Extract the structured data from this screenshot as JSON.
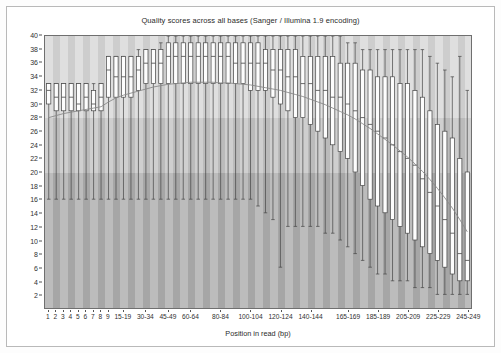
{
  "chart": {
    "title": "Quality scores across all bases (Sanger / Illumina 1.9 encoding)",
    "xlabel": "Position in read (bp)",
    "ylabel": ""
  },
  "chart_data": {
    "type": "box",
    "title": "Quality scores across all bases (Sanger / Illumina 1.9 encoding)",
    "xlabel": "Position in read (bp)",
    "ylabel": "",
    "ylim": [
      0,
      40
    ],
    "ytick_labels": [
      "2",
      "4",
      "6",
      "8",
      "10",
      "12",
      "14",
      "16",
      "18",
      "20",
      "22",
      "24",
      "26",
      "28",
      "30",
      "32",
      "34",
      "36",
      "38",
      "40"
    ],
    "ytick_values": [
      2,
      4,
      6,
      8,
      10,
      12,
      14,
      16,
      18,
      20,
      22,
      24,
      26,
      28,
      30,
      32,
      34,
      36,
      38,
      40
    ],
    "grid": false,
    "legend": null,
    "background_bands": [
      {
        "name": "good-quality-band",
        "from": 28,
        "to": 40,
        "color": "#d9d9d9"
      },
      {
        "name": "reasonable-quality-band",
        "from": 20,
        "to": 28,
        "color": "#c6c6c6"
      },
      {
        "name": "poor-quality-band",
        "from": 0,
        "to": 20,
        "color": "#b0b0b0"
      }
    ],
    "categories": [
      "1",
      "2",
      "3",
      "4",
      "5",
      "6",
      "7",
      "8",
      "9",
      "10-14",
      "15-19",
      "20-24",
      "25-29",
      "30-34",
      "35-39",
      "40-44",
      "45-49",
      "50-54",
      "55-59",
      "60-64",
      "65-69",
      "70-74",
      "75-79",
      "80-84",
      "85-89",
      "90-94",
      "95-99",
      "100-104",
      "105-109",
      "110-114",
      "115-119",
      "120-124",
      "125-129",
      "130-134",
      "135-139",
      "140-144",
      "145-149",
      "150-154",
      "155-159",
      "160-164",
      "165-169",
      "170-174",
      "175-179",
      "180-184",
      "185-189",
      "190-194",
      "195-199",
      "200-204",
      "205-209",
      "210-214",
      "215-219",
      "220-224",
      "225-229",
      "230-234",
      "235-239",
      "240-244",
      "245-249"
    ],
    "xtick_labels": [
      "1",
      "2",
      "3",
      "4",
      "5",
      "6",
      "7",
      "8",
      "9",
      "15-19",
      "30-34",
      "45-49",
      "60-64",
      "80-84",
      "100-104",
      "120-124",
      "140-144",
      "165-169",
      "185-189",
      "205-209",
      "225-229",
      "245-249"
    ],
    "xtick_category_index": [
      0,
      1,
      2,
      3,
      4,
      5,
      6,
      7,
      8,
      10,
      13,
      16,
      19,
      23,
      27,
      31,
      35,
      40,
      44,
      48,
      52,
      56
    ],
    "boxes": [
      {
        "category": "1",
        "lower_whisker": 16,
        "q1": 30,
        "median": 32,
        "q3": 33,
        "upper_whisker": 33
      },
      {
        "category": "2",
        "lower_whisker": 16,
        "q1": 29,
        "median": 31,
        "q3": 33,
        "upper_whisker": 33
      },
      {
        "category": "3",
        "lower_whisker": 16,
        "q1": 29,
        "median": 31,
        "q3": 33,
        "upper_whisker": 33
      },
      {
        "category": "4",
        "lower_whisker": 16,
        "q1": 29,
        "median": 31,
        "q3": 33,
        "upper_whisker": 33
      },
      {
        "category": "5",
        "lower_whisker": 16,
        "q1": 29,
        "median": 30,
        "q3": 33,
        "upper_whisker": 33
      },
      {
        "category": "6",
        "lower_whisker": 16,
        "q1": 29,
        "median": 31,
        "q3": 33,
        "upper_whisker": 33
      },
      {
        "category": "7",
        "lower_whisker": 16,
        "q1": 29,
        "median": 30,
        "q3": 32,
        "upper_whisker": 33
      },
      {
        "category": "8",
        "lower_whisker": 16,
        "q1": 29,
        "median": 31,
        "q3": 33,
        "upper_whisker": 33
      },
      {
        "category": "9",
        "lower_whisker": 16,
        "q1": 31,
        "median": 35,
        "q3": 37,
        "upper_whisker": 37
      },
      {
        "category": "10-14",
        "lower_whisker": 16,
        "q1": 31,
        "median": 34,
        "q3": 37,
        "upper_whisker": 37
      },
      {
        "category": "15-19",
        "lower_whisker": 16,
        "q1": 31,
        "median": 34,
        "q3": 37,
        "upper_whisker": 37
      },
      {
        "category": "20-24",
        "lower_whisker": 16,
        "q1": 31,
        "median": 34,
        "q3": 37,
        "upper_whisker": 37
      },
      {
        "category": "25-29",
        "lower_whisker": 16,
        "q1": 32,
        "median": 35,
        "q3": 37,
        "upper_whisker": 38
      },
      {
        "category": "30-34",
        "lower_whisker": 16,
        "q1": 33,
        "median": 36,
        "q3": 38,
        "upper_whisker": 38
      },
      {
        "category": "35-39",
        "lower_whisker": 16,
        "q1": 33,
        "median": 36,
        "q3": 38,
        "upper_whisker": 38
      },
      {
        "category": "40-44",
        "lower_whisker": 16,
        "q1": 33,
        "median": 36,
        "q3": 38,
        "upper_whisker": 39
      },
      {
        "category": "45-49",
        "lower_whisker": 16,
        "q1": 33,
        "median": 37,
        "q3": 39,
        "upper_whisker": 40
      },
      {
        "category": "50-54",
        "lower_whisker": 16,
        "q1": 33,
        "median": 37,
        "q3": 39,
        "upper_whisker": 40
      },
      {
        "category": "55-59",
        "lower_whisker": 16,
        "q1": 33,
        "median": 37,
        "q3": 39,
        "upper_whisker": 40
      },
      {
        "category": "60-64",
        "lower_whisker": 16,
        "q1": 33,
        "median": 37,
        "q3": 39,
        "upper_whisker": 40
      },
      {
        "category": "65-69",
        "lower_whisker": 16,
        "q1": 33,
        "median": 37,
        "q3": 39,
        "upper_whisker": 40
      },
      {
        "category": "70-74",
        "lower_whisker": 16,
        "q1": 33,
        "median": 37,
        "q3": 39,
        "upper_whisker": 40
      },
      {
        "category": "75-79",
        "lower_whisker": 16,
        "q1": 33,
        "median": 37,
        "q3": 39,
        "upper_whisker": 40
      },
      {
        "category": "80-84",
        "lower_whisker": 16,
        "q1": 33,
        "median": 37,
        "q3": 39,
        "upper_whisker": 40
      },
      {
        "category": "85-89",
        "lower_whisker": 16,
        "q1": 33,
        "median": 37,
        "q3": 39,
        "upper_whisker": 40
      },
      {
        "category": "90-94",
        "lower_whisker": 16,
        "q1": 33,
        "median": 36,
        "q3": 39,
        "upper_whisker": 40
      },
      {
        "category": "95-99",
        "lower_whisker": 16,
        "q1": 33,
        "median": 36,
        "q3": 39,
        "upper_whisker": 40
      },
      {
        "category": "100-104",
        "lower_whisker": 16,
        "q1": 32,
        "median": 36,
        "q3": 39,
        "upper_whisker": 40
      },
      {
        "category": "105-109",
        "lower_whisker": 15,
        "q1": 32,
        "median": 36,
        "q3": 39,
        "upper_whisker": 40
      },
      {
        "category": "110-114",
        "lower_whisker": 14,
        "q1": 32,
        "median": 36,
        "q3": 38,
        "upper_whisker": 40
      },
      {
        "category": "115-119",
        "lower_whisker": 13,
        "q1": 31,
        "median": 35,
        "q3": 38,
        "upper_whisker": 40
      },
      {
        "category": "120-124",
        "lower_whisker": 6,
        "q1": 30,
        "median": 35,
        "q3": 38,
        "upper_whisker": 40
      },
      {
        "category": "125-129",
        "lower_whisker": 12,
        "q1": 29,
        "median": 34,
        "q3": 38,
        "upper_whisker": 40
      },
      {
        "category": "130-134",
        "lower_whisker": 12,
        "q1": 28,
        "median": 34,
        "q3": 38,
        "upper_whisker": 40
      },
      {
        "category": "135-139",
        "lower_whisker": 12,
        "q1": 28,
        "median": 33,
        "q3": 37,
        "upper_whisker": 40
      },
      {
        "category": "140-144",
        "lower_whisker": 12,
        "q1": 27,
        "median": 33,
        "q3": 37,
        "upper_whisker": 40
      },
      {
        "category": "145-149",
        "lower_whisker": 12,
        "q1": 26,
        "median": 32,
        "q3": 37,
        "upper_whisker": 40
      },
      {
        "category": "150-154",
        "lower_whisker": 11,
        "q1": 25,
        "median": 32,
        "q3": 37,
        "upper_whisker": 40
      },
      {
        "category": "155-159",
        "lower_whisker": 11,
        "q1": 24,
        "median": 31,
        "q3": 37,
        "upper_whisker": 40
      },
      {
        "category": "160-164",
        "lower_whisker": 10,
        "q1": 23,
        "median": 31,
        "q3": 36,
        "upper_whisker": 40
      },
      {
        "category": "165-169",
        "lower_whisker": 9,
        "q1": 22,
        "median": 30,
        "q3": 36,
        "upper_whisker": 39
      },
      {
        "category": "170-174",
        "lower_whisker": 8,
        "q1": 20,
        "median": 29,
        "q3": 36,
        "upper_whisker": 39
      },
      {
        "category": "175-179",
        "lower_whisker": 7,
        "q1": 18,
        "median": 28,
        "q3": 35,
        "upper_whisker": 38
      },
      {
        "category": "180-184",
        "lower_whisker": 6,
        "q1": 16,
        "median": 27,
        "q3": 35,
        "upper_whisker": 38
      },
      {
        "category": "185-189",
        "lower_whisker": 5,
        "q1": 15,
        "median": 26,
        "q3": 34,
        "upper_whisker": 38
      },
      {
        "category": "190-194",
        "lower_whisker": 5,
        "q1": 14,
        "median": 25,
        "q3": 34,
        "upper_whisker": 38
      },
      {
        "category": "195-199",
        "lower_whisker": 4,
        "q1": 13,
        "median": 24,
        "q3": 34,
        "upper_whisker": 38
      },
      {
        "category": "200-204",
        "lower_whisker": 4,
        "q1": 12,
        "median": 23,
        "q3": 33,
        "upper_whisker": 38
      },
      {
        "category": "205-209",
        "lower_whisker": 4,
        "q1": 11,
        "median": 22,
        "q3": 33,
        "upper_whisker": 38
      },
      {
        "category": "210-214",
        "lower_whisker": 3,
        "q1": 10,
        "median": 21,
        "q3": 32,
        "upper_whisker": 38
      },
      {
        "category": "215-219",
        "lower_whisker": 3,
        "q1": 9,
        "median": 19,
        "q3": 31,
        "upper_whisker": 38
      },
      {
        "category": "220-224",
        "lower_whisker": 3,
        "q1": 8,
        "median": 17,
        "q3": 29,
        "upper_whisker": 37
      },
      {
        "category": "225-229",
        "lower_whisker": 2,
        "q1": 7,
        "median": 15,
        "q3": 27,
        "upper_whisker": 36
      },
      {
        "category": "230-234",
        "lower_whisker": 2,
        "q1": 6,
        "median": 13,
        "q3": 26,
        "upper_whisker": 35
      },
      {
        "category": "235-239",
        "lower_whisker": 2,
        "q1": 5,
        "median": 11,
        "q3": 25,
        "upper_whisker": 34
      },
      {
        "category": "240-244",
        "lower_whisker": 2,
        "q1": 4,
        "median": 8,
        "q3": 22,
        "upper_whisker": 37
      },
      {
        "category": "245-249",
        "lower_whisker": 2,
        "q1": 4,
        "median": 7,
        "q3": 20,
        "upper_whisker": 32
      }
    ],
    "mean_line": {
      "name": "mean-quality-line",
      "color": "#8a8a8a",
      "values": [
        28.0,
        28.3,
        28.6,
        28.8,
        29.0,
        29.2,
        29.4,
        29.6,
        30.3,
        30.9,
        31.3,
        31.6,
        31.9,
        32.2,
        32.5,
        32.7,
        32.9,
        33.0,
        33.1,
        33.2,
        33.2,
        33.2,
        33.2,
        33.1,
        33.1,
        33.0,
        32.9,
        32.8,
        32.6,
        32.4,
        32.2,
        32.0,
        31.7,
        31.4,
        31.1,
        30.7,
        30.3,
        29.9,
        29.4,
        28.9,
        28.4,
        27.8,
        27.1,
        26.4,
        25.6,
        24.8,
        24.0,
        23.1,
        22.2,
        21.2,
        20.1,
        18.9,
        17.6,
        16.2,
        14.7,
        13.0,
        11.2
      ]
    }
  }
}
